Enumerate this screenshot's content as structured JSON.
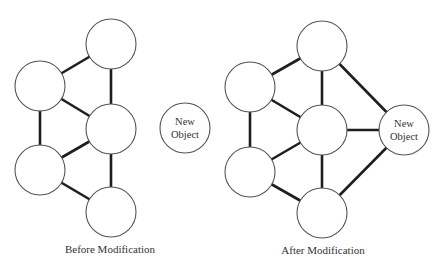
{
  "diagram": {
    "colors": {
      "edge": "#1e1e1e",
      "node_stroke": "#555555",
      "node_fill": "#ffffff",
      "text": "#333333"
    },
    "node_radius": 25,
    "before": {
      "caption": "Before Modification",
      "caption_pos": [
        110,
        253
      ],
      "nodes": [
        {
          "id": "A",
          "x": 111,
          "y": 44,
          "label": []
        },
        {
          "id": "B",
          "x": 40,
          "y": 86,
          "label": []
        },
        {
          "id": "C",
          "x": 111,
          "y": 129,
          "label": []
        },
        {
          "id": "D",
          "x": 40,
          "y": 170,
          "label": []
        },
        {
          "id": "E",
          "x": 111,
          "y": 212,
          "label": []
        }
      ],
      "edges": [
        [
          "A",
          "B"
        ],
        [
          "A",
          "C"
        ],
        [
          "B",
          "C"
        ],
        [
          "B",
          "D"
        ],
        [
          "C",
          "D"
        ],
        [
          "C",
          "E"
        ],
        [
          "D",
          "E"
        ]
      ]
    },
    "standalone": {
      "nodes": [
        {
          "id": "N",
          "x": 185,
          "y": 128,
          "label": [
            "New",
            "Object"
          ]
        }
      ],
      "edges": []
    },
    "after": {
      "caption": "After Modification",
      "caption_pos": [
        323,
        254
      ],
      "nodes": [
        {
          "id": "A",
          "x": 322,
          "y": 46,
          "label": []
        },
        {
          "id": "B",
          "x": 250,
          "y": 87,
          "label": []
        },
        {
          "id": "C",
          "x": 322,
          "y": 130,
          "label": []
        },
        {
          "id": "D",
          "x": 250,
          "y": 172,
          "label": []
        },
        {
          "id": "E",
          "x": 322,
          "y": 213,
          "label": []
        },
        {
          "id": "N",
          "x": 404,
          "y": 130,
          "label": [
            "New",
            "Object"
          ]
        }
      ],
      "edges": [
        [
          "A",
          "B"
        ],
        [
          "A",
          "C"
        ],
        [
          "B",
          "C"
        ],
        [
          "B",
          "D"
        ],
        [
          "C",
          "D"
        ],
        [
          "C",
          "E"
        ],
        [
          "D",
          "E"
        ],
        [
          "A",
          "N"
        ],
        [
          "C",
          "N"
        ],
        [
          "E",
          "N"
        ]
      ]
    }
  }
}
